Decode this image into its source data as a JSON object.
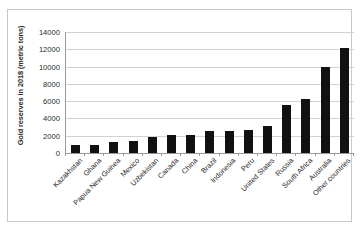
{
  "chart_data": {
    "type": "bar",
    "title": "",
    "xlabel": "",
    "ylabel": "Gold reserves in 2018 (metric tons)",
    "ylim": [
      0,
      14000
    ],
    "yticks": [
      0,
      2000,
      4000,
      6000,
      8000,
      10000,
      12000,
      14000
    ],
    "ytick_labels": [
      "0",
      "2000",
      "4000",
      "6000",
      "8000",
      "10000",
      "12000",
      "14000"
    ],
    "grid": true,
    "legend": false,
    "bar_color": "#111111",
    "gridline_color": "#d2d2d2",
    "axis_color": "#9a9a9a",
    "categories": [
      "Kazakhstan",
      "Ghana",
      "Papua New Guinea",
      "Mexico",
      "Uzbekistan",
      "Canada",
      "China",
      "Brazil",
      "Indonesia",
      "Peru",
      "United States",
      "Russia",
      "South Africa",
      "Australia",
      "Other countries"
    ],
    "values": [
      900,
      900,
      1250,
      1400,
      1800,
      2050,
      2050,
      2500,
      2550,
      2700,
      3150,
      5500,
      6200,
      9900,
      12200
    ]
  }
}
